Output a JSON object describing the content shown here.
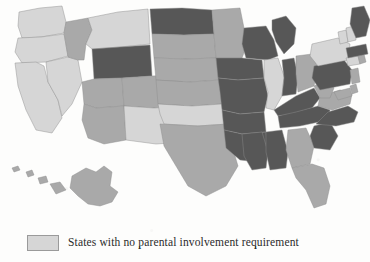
{
  "figure": {
    "kind": "choropleth-map",
    "region": "United States",
    "background_color": "#fdfdfc"
  },
  "legend": {
    "position": "bottom-left",
    "clipped_at_image_edge": true,
    "entries": [
      {
        "swatch_color": "#d6d6d6",
        "label": "States with no parental involvement requirement"
      }
    ]
  },
  "shading": {
    "light": "#d6d6d6",
    "medium": "#a9a9a9",
    "dark": "#575757",
    "border": "#8d8d8d"
  },
  "map_data": {
    "type": "choropleth",
    "value_key": "shade",
    "states": [
      {
        "code": "WA",
        "name": "Washington",
        "shade": "light"
      },
      {
        "code": "OR",
        "name": "Oregon",
        "shade": "light"
      },
      {
        "code": "CA",
        "name": "California",
        "shade": "light"
      },
      {
        "code": "NV",
        "name": "Nevada",
        "shade": "light"
      },
      {
        "code": "ID",
        "name": "Idaho",
        "shade": "medium"
      },
      {
        "code": "MT",
        "name": "Montana",
        "shade": "light"
      },
      {
        "code": "WY",
        "name": "Wyoming",
        "shade": "dark"
      },
      {
        "code": "UT",
        "name": "Utah",
        "shade": "medium"
      },
      {
        "code": "AZ",
        "name": "Arizona",
        "shade": "medium"
      },
      {
        "code": "CO",
        "name": "Colorado",
        "shade": "medium"
      },
      {
        "code": "NM",
        "name": "New Mexico",
        "shade": "light"
      },
      {
        "code": "ND",
        "name": "North Dakota",
        "shade": "dark"
      },
      {
        "code": "SD",
        "name": "South Dakota",
        "shade": "medium"
      },
      {
        "code": "NE",
        "name": "Nebraska",
        "shade": "medium"
      },
      {
        "code": "KS",
        "name": "Kansas",
        "shade": "medium"
      },
      {
        "code": "OK",
        "name": "Oklahoma",
        "shade": "light"
      },
      {
        "code": "TX",
        "name": "Texas",
        "shade": "medium"
      },
      {
        "code": "MN",
        "name": "Minnesota",
        "shade": "medium"
      },
      {
        "code": "IA",
        "name": "Iowa",
        "shade": "dark"
      },
      {
        "code": "MO",
        "name": "Missouri",
        "shade": "dark"
      },
      {
        "code": "AR",
        "name": "Arkansas",
        "shade": "dark"
      },
      {
        "code": "LA",
        "name": "Louisiana",
        "shade": "dark"
      },
      {
        "code": "WI",
        "name": "Wisconsin",
        "shade": "dark"
      },
      {
        "code": "IL",
        "name": "Illinois",
        "shade": "light"
      },
      {
        "code": "MI",
        "name": "Michigan",
        "shade": "dark"
      },
      {
        "code": "IN",
        "name": "Indiana",
        "shade": "dark"
      },
      {
        "code": "OH",
        "name": "Ohio",
        "shade": "medium"
      },
      {
        "code": "KY",
        "name": "Kentucky",
        "shade": "dark"
      },
      {
        "code": "TN",
        "name": "Tennessee",
        "shade": "dark"
      },
      {
        "code": "MS",
        "name": "Mississippi",
        "shade": "dark"
      },
      {
        "code": "AL",
        "name": "Alabama",
        "shade": "dark"
      },
      {
        "code": "GA",
        "name": "Georgia",
        "shade": "medium"
      },
      {
        "code": "FL",
        "name": "Florida",
        "shade": "medium"
      },
      {
        "code": "SC",
        "name": "South Carolina",
        "shade": "dark"
      },
      {
        "code": "NC",
        "name": "North Carolina",
        "shade": "dark"
      },
      {
        "code": "VA",
        "name": "Virginia",
        "shade": "medium"
      },
      {
        "code": "WV",
        "name": "West Virginia",
        "shade": "medium"
      },
      {
        "code": "MD",
        "name": "Maryland",
        "shade": "medium"
      },
      {
        "code": "DE",
        "name": "Delaware",
        "shade": "medium"
      },
      {
        "code": "PA",
        "name": "Pennsylvania",
        "shade": "dark"
      },
      {
        "code": "NJ",
        "name": "New Jersey",
        "shade": "medium"
      },
      {
        "code": "NY",
        "name": "New York",
        "shade": "light"
      },
      {
        "code": "CT",
        "name": "Connecticut",
        "shade": "light"
      },
      {
        "code": "RI",
        "name": "Rhode Island",
        "shade": "medium"
      },
      {
        "code": "MA",
        "name": "Massachusetts",
        "shade": "dark"
      },
      {
        "code": "VT",
        "name": "Vermont",
        "shade": "light"
      },
      {
        "code": "NH",
        "name": "New Hampshire",
        "shade": "light"
      },
      {
        "code": "ME",
        "name": "Maine",
        "shade": "dark"
      },
      {
        "code": "AK",
        "name": "Alaska",
        "shade": "medium"
      },
      {
        "code": "HI",
        "name": "Hawaii",
        "shade": "medium"
      }
    ]
  }
}
